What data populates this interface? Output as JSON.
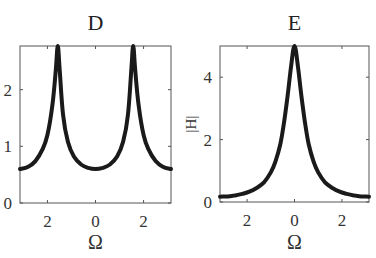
{
  "chart_data": [
    {
      "type": "line",
      "title": "D",
      "xlabel": "Ω",
      "ylabel": "",
      "xlim": [
        -3.1416,
        3.1416
      ],
      "ylim": [
        0,
        2.77
      ],
      "xticks": [
        -2,
        0,
        2
      ],
      "xtick_labels": [
        "2",
        "0",
        "2"
      ],
      "yticks": [
        0,
        1,
        2
      ],
      "ytick_labels": [
        "0",
        "1",
        "2"
      ],
      "grid": false,
      "legend": null,
      "description": "Two symmetric resonance peaks at Ω ≈ ±π/2 reaching the top of the axis (~2.77); minima ≈ 0.6 at Ω = 0 and Ω = ±π",
      "series": [
        {
          "name": "D",
          "x": [
            -3.14,
            -2.8,
            -2.5,
            -2.2,
            -2.0,
            -1.8,
            -1.65,
            -1.57,
            -1.49,
            -1.35,
            -1.15,
            -0.9,
            -0.6,
            -0.3,
            0,
            0.3,
            0.6,
            0.9,
            1.15,
            1.35,
            1.49,
            1.57,
            1.65,
            1.8,
            2.0,
            2.2,
            2.5,
            2.8,
            3.14
          ],
          "y": [
            0.6,
            0.64,
            0.74,
            0.95,
            1.2,
            1.7,
            2.35,
            2.77,
            2.35,
            1.55,
            1.08,
            0.82,
            0.68,
            0.62,
            0.6,
            0.62,
            0.68,
            0.82,
            1.08,
            1.55,
            2.35,
            2.77,
            2.35,
            1.7,
            1.2,
            0.95,
            0.74,
            0.64,
            0.6
          ]
        }
      ]
    },
    {
      "type": "line",
      "title": "E",
      "xlabel": "Ω",
      "ylabel": "|H|",
      "xlim": [
        -3.1416,
        3.1416
      ],
      "ylim": [
        0,
        5
      ],
      "xticks": [
        -2,
        0,
        2
      ],
      "xtick_labels": [
        "2",
        "0",
        "2"
      ],
      "yticks": [
        0,
        2,
        4
      ],
      "ytick_labels": [
        "0",
        "2",
        "4"
      ],
      "grid": false,
      "legend": null,
      "description": "Single sharp resonance peak at Ω = 0 reaching 5; tails decay to ≈ 0.17 at Ω = ±π",
      "series": [
        {
          "name": "E",
          "x": [
            -3.14,
            -2.8,
            -2.5,
            -2.2,
            -1.9,
            -1.6,
            -1.3,
            -1.0,
            -0.8,
            -0.6,
            -0.45,
            -0.3,
            -0.15,
            0,
            0.15,
            0.3,
            0.45,
            0.6,
            0.8,
            1.0,
            1.3,
            1.6,
            1.9,
            2.2,
            2.5,
            2.8,
            3.14
          ],
          "y": [
            0.17,
            0.18,
            0.21,
            0.26,
            0.33,
            0.45,
            0.62,
            0.95,
            1.3,
            1.85,
            2.5,
            3.35,
            4.3,
            5.0,
            4.3,
            3.35,
            2.5,
            1.85,
            1.3,
            0.95,
            0.62,
            0.45,
            0.33,
            0.26,
            0.21,
            0.18,
            0.17
          ]
        }
      ]
    }
  ],
  "panels": [
    {
      "title": "D",
      "xlabel": "Ω",
      "ylabel": ""
    },
    {
      "title": "E",
      "xlabel": "Ω",
      "ylabel": "|H|"
    }
  ]
}
